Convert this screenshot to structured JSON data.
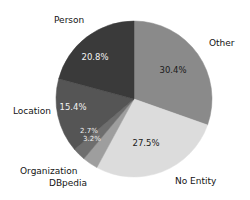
{
  "chart_data": {
    "type": "pie",
    "title": "",
    "subtitle": "",
    "xlabel": "",
    "ylabel": "",
    "legend_position": "outside-labels",
    "grid": false,
    "start_angle_deg": 90,
    "direction": "clockwise",
    "categories": [
      "Other",
      "No Entity",
      "DBpedia",
      "Organization",
      "Location",
      "Person"
    ],
    "values": [
      30.4,
      27.5,
      3.2,
      2.7,
      15.4,
      20.8
    ],
    "value_labels": [
      "30.4%",
      "27.5%",
      "3.2%",
      "2.7%",
      "15.4%",
      "20.8%"
    ],
    "colors": [
      "#8a8a8a",
      "#dcdcdc",
      "#9e9e9e",
      "#6e6e6e",
      "#555555",
      "#3a3a3a"
    ],
    "total": 100.0,
    "slices": [
      {
        "name": "Other",
        "value": 30.4,
        "value_label": "30.4%",
        "color": "#8a8a8a",
        "label_text_color": "#1a1a1a",
        "category_label": "Other",
        "category_label_x": 209,
        "category_label_y": 38,
        "value_label_x": 173,
        "value_label_y": 70
      },
      {
        "name": "No Entity",
        "value": 27.5,
        "value_label": "27.5%",
        "color": "#dcdcdc",
        "label_text_color": "#1a1a1a",
        "category_label": "No Entity",
        "category_label_x": 175,
        "category_label_y": 176,
        "value_label_x": 146,
        "value_label_y": 143
      },
      {
        "name": "DBpedia",
        "value": 3.2,
        "value_label": "3.2%",
        "color": "#9e9e9e",
        "label_text_color": "#f2f2f2",
        "category_label": "DBpedia",
        "category_label_x": 49,
        "category_label_y": 178,
        "value_label_x": 92,
        "value_label_y": 139
      },
      {
        "name": "Organization",
        "value": 2.7,
        "value_label": "2.7%",
        "color": "#6e6e6e",
        "label_text_color": "#f2f2f2",
        "category_label": "Organization",
        "category_label_x": 20,
        "category_label_y": 166,
        "value_label_x": 89,
        "value_label_y": 131
      },
      {
        "name": "Location",
        "value": 15.4,
        "value_label": "15.4%",
        "color": "#555555",
        "label_text_color": "#f2f2f2",
        "category_label": "Location",
        "category_label_x": 13,
        "category_label_y": 106,
        "value_label_x": 73,
        "value_label_y": 107
      },
      {
        "name": "Person",
        "value": 20.8,
        "value_label": "20.8%",
        "color": "#3a3a3a",
        "label_text_color": "#f2f2f2",
        "category_label": "Person",
        "category_label_x": 54,
        "category_label_y": 15,
        "value_label_x": 95,
        "value_label_y": 57
      }
    ],
    "geometry": {
      "center_x": 134,
      "center_y": 99,
      "radius": 78
    }
  }
}
